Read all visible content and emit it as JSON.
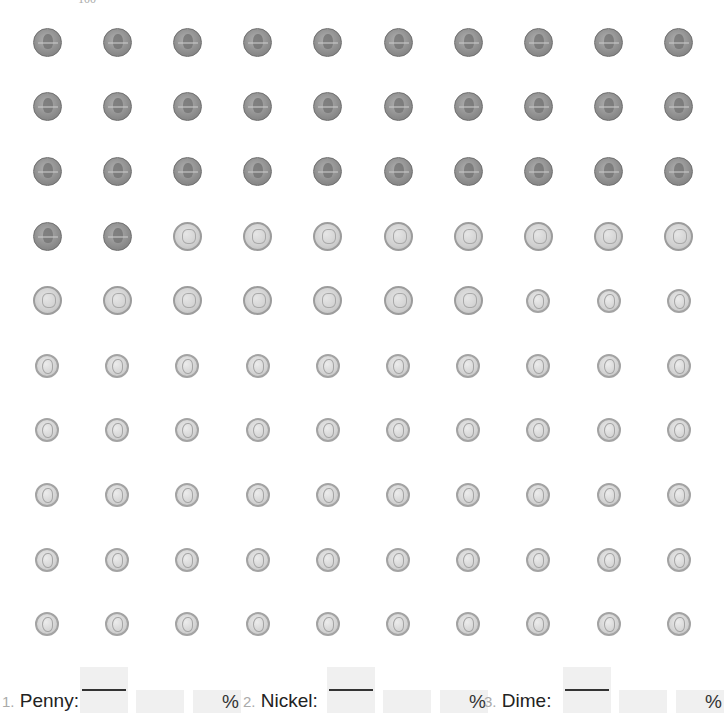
{
  "header": {
    "partial_label": "100"
  },
  "grid": {
    "rows": 10,
    "cols": 10,
    "coins": [
      "penny",
      "penny",
      "penny",
      "penny",
      "penny",
      "penny",
      "penny",
      "penny",
      "penny",
      "penny",
      "penny",
      "penny",
      "penny",
      "penny",
      "penny",
      "penny",
      "penny",
      "penny",
      "penny",
      "penny",
      "penny",
      "penny",
      "penny",
      "penny",
      "penny",
      "penny",
      "penny",
      "penny",
      "penny",
      "penny",
      "penny",
      "penny",
      "nickel",
      "nickel",
      "nickel",
      "nickel",
      "nickel",
      "nickel",
      "nickel",
      "nickel",
      "nickel",
      "nickel",
      "nickel",
      "nickel",
      "nickel",
      "nickel",
      "nickel",
      "dime",
      "dime",
      "dime",
      "dime",
      "dime",
      "dime",
      "dime",
      "dime",
      "dime",
      "dime",
      "dime",
      "dime",
      "dime",
      "dime",
      "dime",
      "dime",
      "dime",
      "dime",
      "dime",
      "dime",
      "dime",
      "dime",
      "dime",
      "dime",
      "dime",
      "dime",
      "dime",
      "dime",
      "dime",
      "dime",
      "dime",
      "dime",
      "dime",
      "dime",
      "dime",
      "dime",
      "dime",
      "dime",
      "dime",
      "dime",
      "dime",
      "dime",
      "dime",
      "dime",
      "dime",
      "dime",
      "dime",
      "dime",
      "dime",
      "dime",
      "dime",
      "dime",
      "dime"
    ],
    "counts": {
      "penny": 32,
      "nickel": 15,
      "dime": 53
    }
  },
  "questions": [
    {
      "number": "1.",
      "label": "Penny:",
      "numerator": "",
      "denominator": "",
      "decimal": "",
      "percent_value": "",
      "percent_symbol": "%"
    },
    {
      "number": "2.",
      "label": "Nickel:",
      "numerator": "",
      "denominator": "",
      "decimal": "",
      "percent_value": "",
      "percent_symbol": "%"
    },
    {
      "number": "3.",
      "label": "Dime:",
      "numerator": "",
      "denominator": "",
      "decimal": "",
      "percent_value": "",
      "percent_symbol": "%"
    }
  ]
}
